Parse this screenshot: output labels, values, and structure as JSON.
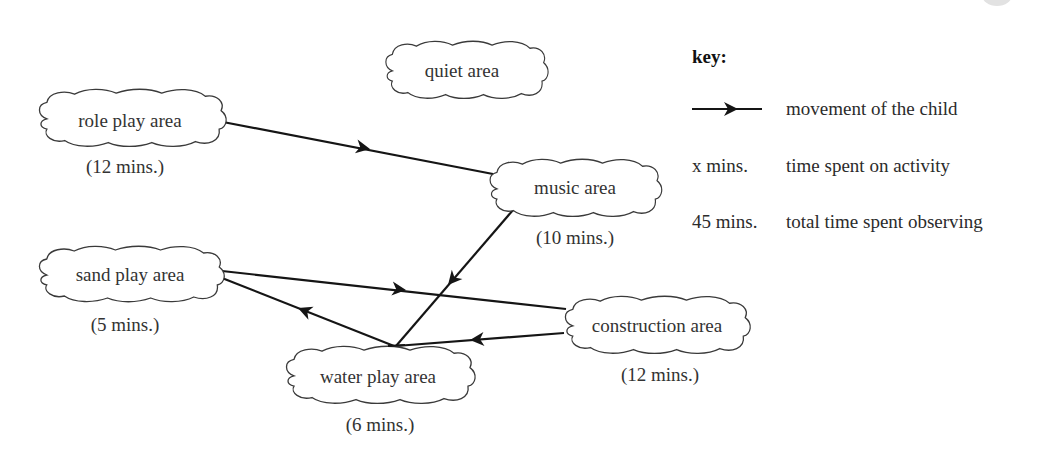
{
  "diagram": {
    "nodes": [
      {
        "id": "role_play",
        "label": "role play area",
        "time": "(12 mins.)"
      },
      {
        "id": "quiet",
        "label": "quiet area",
        "time": null
      },
      {
        "id": "music",
        "label": "music area",
        "time": "(10 mins.)"
      },
      {
        "id": "sand_play",
        "label": "sand play area",
        "time": "(5 mins.)"
      },
      {
        "id": "construction",
        "label": "construction area",
        "time": "(12 mins.)"
      },
      {
        "id": "water_play",
        "label": "water play area",
        "time": "(6 mins.)"
      }
    ],
    "edges": [
      {
        "from": "role_play",
        "to": "music",
        "order": 1
      },
      {
        "from": "music",
        "to": "water_play",
        "order": 2
      },
      {
        "from": "water_play",
        "to": "sand_play",
        "order": 3
      },
      {
        "from": "sand_play",
        "to": "construction",
        "order": 4
      },
      {
        "from": "construction",
        "to": "water_play",
        "order": 5
      }
    ]
  },
  "key": {
    "title": "key:",
    "rows": [
      {
        "symbol": "arrow-line",
        "label": "",
        "description": "movement of the child"
      },
      {
        "symbol": "text",
        "label": "x mins.",
        "description": "time spent on activity"
      },
      {
        "symbol": "text",
        "label": "45 mins.",
        "description": "total time spent observing"
      }
    ]
  },
  "colors": {
    "line": "#151515",
    "cloud_stroke": "#3a3a3a",
    "text": "#333333",
    "background": "#ffffff"
  }
}
